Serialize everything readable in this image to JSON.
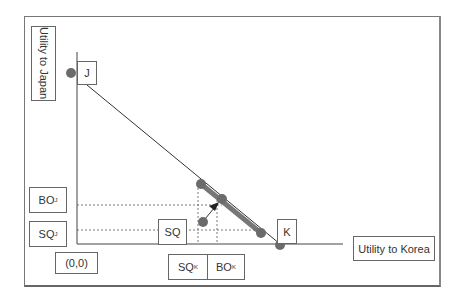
{
  "diagram": {
    "y_axis_label": "Utility to Japan",
    "x_axis_label": "Utility to Korea",
    "origin_label": "(0,0)",
    "point_labels": {
      "J": "J",
      "K": "K",
      "SQ": "SQ"
    },
    "y_tick_labels": [
      {
        "main": "BO",
        "sub": "J"
      },
      {
        "main": "SQ",
        "sub": "J"
      }
    ],
    "x_tick_labels": [
      {
        "main": "SQ",
        "sub": "K"
      },
      {
        "main": "BO",
        "sub": "K"
      }
    ],
    "colors": {
      "line": "#333333",
      "segment": "#777777",
      "dot": "#6b6b6b",
      "frame": "#777777"
    }
  }
}
